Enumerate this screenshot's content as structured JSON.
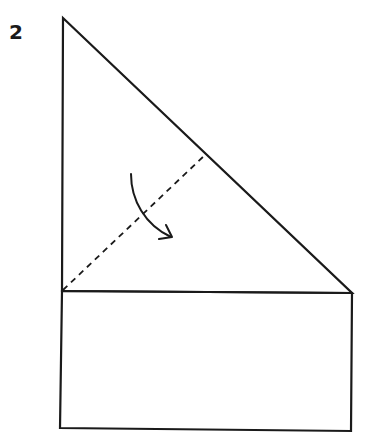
{
  "diagram": {
    "type": "origami-fold-instruction",
    "step_number": "2",
    "colors": {
      "stroke": "#1a1a1a",
      "background": "#ffffff"
    },
    "shapes": {
      "triangle": {
        "points": [
          [
            63,
            18
          ],
          [
            352,
            293
          ],
          [
            62,
            291
          ]
        ]
      },
      "rectangle": {
        "points": [
          [
            62,
            291
          ],
          [
            352,
            293
          ],
          [
            351,
            431
          ],
          [
            60,
            428
          ]
        ]
      },
      "fold_line": {
        "style": "dashed",
        "from": [
          63,
          290
        ],
        "to": [
          205,
          155
        ]
      },
      "fold_arrow": {
        "direction": "down-right",
        "start": [
          131,
          174
        ],
        "end": [
          172,
          237
        ]
      }
    }
  }
}
